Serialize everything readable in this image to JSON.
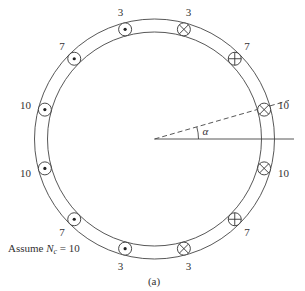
{
  "figure": {
    "caption": "(a)",
    "note_prefix": "Assume ",
    "note_var": "N",
    "note_sub": "c",
    "note_suffix": " = 10",
    "angle_label": "α"
  },
  "geometry": {
    "cx": 154.5,
    "cy": 139,
    "outer_r": 120,
    "inner_r": 107,
    "slot_r": 113.5,
    "label_r": 131,
    "symbol_r": 6.5,
    "dashed_angle_deg": 16,
    "axis_end_x": 294,
    "dashed_len": 140,
    "alpha_arc_r": 44
  },
  "conductors": [
    {
      "angle": 15,
      "turns": "10",
      "symbol": "cross"
    },
    {
      "angle": 45,
      "turns": "7",
      "symbol": "plus"
    },
    {
      "angle": 75,
      "turns": "3",
      "symbol": "cross"
    },
    {
      "angle": 105,
      "turns": "3",
      "symbol": "dot"
    },
    {
      "angle": 135,
      "turns": "7",
      "symbol": "dot"
    },
    {
      "angle": 165,
      "turns": "10",
      "symbol": "dot"
    },
    {
      "angle": 195,
      "turns": "10",
      "symbol": "dot"
    },
    {
      "angle": 225,
      "turns": "7",
      "symbol": "dot"
    },
    {
      "angle": 255,
      "turns": "3",
      "symbol": "dot"
    },
    {
      "angle": 285,
      "turns": "3",
      "symbol": "cross"
    },
    {
      "angle": 315,
      "turns": "7",
      "symbol": "plus"
    },
    {
      "angle": 345,
      "turns": "10",
      "symbol": "cross"
    }
  ],
  "colors": {
    "line": "#444444",
    "text": "#333333",
    "background": "#ffffff"
  }
}
